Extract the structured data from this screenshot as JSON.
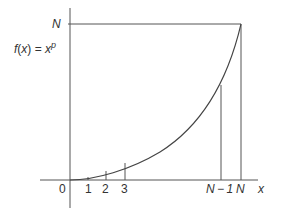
{
  "diagram": {
    "function_label": "f(x) = x",
    "function_exponent": "p",
    "y_axis_top_label": "N",
    "x_axis_label": "x",
    "origin_label": "0",
    "x_ticks": [
      "1",
      "2",
      "3",
      "N − 1",
      "N"
    ],
    "colors": {
      "line": "#555555",
      "text": "#333333",
      "background": "#ffffff"
    }
  }
}
